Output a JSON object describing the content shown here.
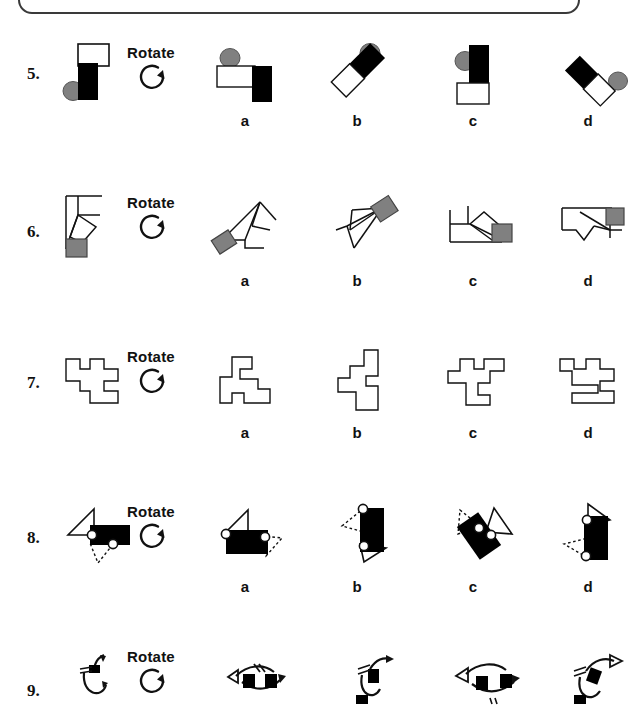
{
  "page": {
    "kind": "worksheet",
    "background": "#ffffff",
    "ink": "#111111",
    "gray_fill": "#808080",
    "black_fill": "#000000",
    "white_fill": "#ffffff"
  },
  "topbox": {
    "name": "instruction-box-bottom-edge"
  },
  "option_labels": [
    "a",
    "b",
    "c",
    "d"
  ],
  "rotate_label": "Rotate",
  "rotate_icon": "circular-arrow-clockwise-icon",
  "questions": [
    {
      "number": "5.",
      "prompt_name": "question-5-prompt-figure",
      "prompt_desc": "white-horizontal-rectangle-black-vertical-rectangle-gray-circle",
      "options": [
        {
          "label": "a",
          "desc": "white-rectangle-left-black-rectangle-right-gray-circle-top-left"
        },
        {
          "label": "b",
          "desc": "black-bar-diagonal-white-rectangle-diagonal-gray-circle-top"
        },
        {
          "label": "c",
          "desc": "black-vertical-bar-white-rectangle-below-gray-circle-top-left"
        },
        {
          "label": "d",
          "desc": "white-rectangle-diagonal-black-bar-diagonal-gray-circle-right"
        }
      ]
    },
    {
      "number": "6.",
      "prompt_name": "question-6-prompt-figure",
      "prompt_desc": "outline-polygon-with-gray-square-bottom",
      "options": [
        {
          "label": "a",
          "desc": "rotated-polygon-gray-square-lower-left"
        },
        {
          "label": "b",
          "desc": "rotated-polygon-gray-square-upper-right"
        },
        {
          "label": "c",
          "desc": "polygon-gray-square-right"
        },
        {
          "label": "d",
          "desc": "polygon-gray-square-right-top"
        }
      ]
    },
    {
      "number": "7.",
      "prompt_name": "question-7-prompt-figure",
      "prompt_desc": "outline-polyomino-double-t-shape",
      "options": [
        {
          "label": "a",
          "desc": "polyomino-rotated-variant-a"
        },
        {
          "label": "b",
          "desc": "polyomino-rotated-variant-b"
        },
        {
          "label": "c",
          "desc": "polyomino-rotated-variant-c"
        },
        {
          "label": "d",
          "desc": "polyomino-rotated-variant-d"
        }
      ]
    },
    {
      "number": "8.",
      "prompt_name": "question-8-prompt-figure",
      "prompt_desc": "black-rectangle-solid-triangle-dotted-triangle-two-white-circles",
      "options": [
        {
          "label": "a",
          "desc": "black-rectangle-open-triangle-left-dotted-triangle-right"
        },
        {
          "label": "b",
          "desc": "black-rectangle-vertical-dotted-triangle-upper-left-open-triangle-lower-right"
        },
        {
          "label": "c",
          "desc": "black-rectangle-tilted-dotted-triangle-left-open-triangle-right"
        },
        {
          "label": "d",
          "desc": "black-rectangle-vertical-open-triangle-upper-right-dotted-triangle-lower-left"
        }
      ]
    },
    {
      "number": "9.",
      "prompt_name": "question-9-prompt-figure",
      "prompt_desc": "curved-arrows-with-black-squares",
      "options": [
        {
          "label": "a",
          "desc": "curved-arrows-variant-a"
        },
        {
          "label": "b",
          "desc": "curved-arrows-variant-b"
        },
        {
          "label": "c",
          "desc": "curved-arrows-variant-c"
        },
        {
          "label": "d",
          "desc": "curved-arrows-variant-d"
        }
      ]
    }
  ]
}
